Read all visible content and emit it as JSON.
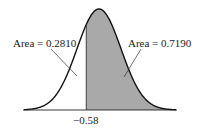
{
  "chart_data": {
    "type": "area",
    "title": "",
    "distribution": "standard normal",
    "cutoff": -0.58,
    "cutoff_label": "−0.58",
    "regions": [
      {
        "name": "left",
        "area": 0.281,
        "label": "Area = 0.2810",
        "shaded": false
      },
      {
        "name": "right",
        "area": 0.719,
        "label": "Area = 0.7190",
        "shaded": true
      }
    ],
    "shade_color": "#a9a9a9",
    "curve_color": "#111111",
    "xlabel": "",
    "ylabel": "",
    "grid": false
  }
}
